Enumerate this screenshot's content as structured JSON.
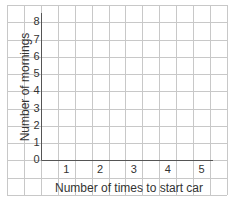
{
  "chart_data": {
    "type": "bar",
    "title": "",
    "xlabel": "Number of times to start car",
    "ylabel": "Number of mornings",
    "categories": [
      "1",
      "2",
      "3",
      "4",
      "5"
    ],
    "values": [
      null,
      null,
      null,
      null,
      null
    ],
    "yticks": [
      "0",
      "1",
      "2",
      "3",
      "4",
      "5",
      "6",
      "7",
      "8"
    ],
    "ylim": [
      0,
      8
    ],
    "grid": true,
    "legend": null,
    "note": "Blank grid template; no data plotted"
  },
  "colors": {
    "grid": "#c8c8c8",
    "axis": "#555555",
    "text": "#333333"
  }
}
